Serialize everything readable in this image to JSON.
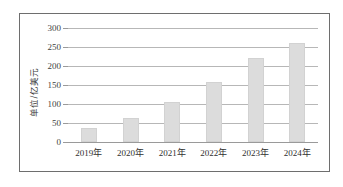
{
  "chart_data": {
    "type": "bar",
    "title": "",
    "xlabel": "",
    "ylabel": "单位/亿美元",
    "categories": [
      "2019年",
      "2020年",
      "2021年",
      "2022年",
      "2023年",
      "2024年"
    ],
    "values": [
      38,
      63,
      106,
      157,
      222,
      260
    ],
    "series": [
      {
        "name": "",
        "values": [
          38,
          63,
          106,
          157,
          222,
          260
        ]
      }
    ],
    "ylim": [
      0,
      300
    ],
    "yticks": [
      0,
      50,
      100,
      150,
      200,
      250,
      300
    ],
    "ytick_labels": [
      "0",
      "50",
      "100",
      "150",
      "200",
      "250",
      "300"
    ],
    "grid": true,
    "legend": false,
    "legend_position": "none",
    "bar_color": "#dcdcdc",
    "gridline_color": "#b7b7b7",
    "axis_color": "#9a9a9a",
    "frame_color": "#6e6e6e",
    "background": "#ffffff"
  }
}
